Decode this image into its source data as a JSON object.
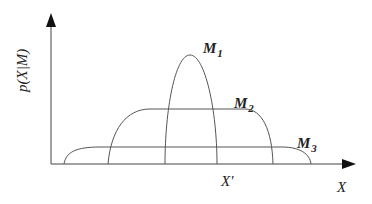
{
  "figure": {
    "type": "diagram",
    "y_axis_label": "p(X|M)",
    "x_axis_label": "X",
    "marker_label": "X'",
    "curves": [
      {
        "id": "M1",
        "label_main": "M",
        "label_sub": "1",
        "shape": "narrow-peaked"
      },
      {
        "id": "M2",
        "label_main": "M",
        "label_sub": "2",
        "shape": "medium-flat-top"
      },
      {
        "id": "M3",
        "label_main": "M",
        "label_sub": "3",
        "shape": "wide-flat-low"
      }
    ]
  }
}
